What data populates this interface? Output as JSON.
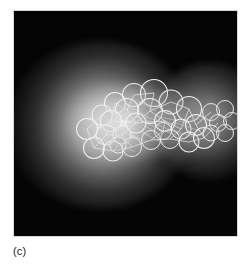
{
  "figure": {
    "caption_label": "(c)",
    "panel_background_color": "#050505",
    "panel_border_color": "#d8d8d8",
    "page_background_color": "#ffffff",
    "caption_text_color": "#1a1a1a",
    "overlay_stroke_color": "#f0f0f0",
    "title": "",
    "alt_description": "Grayscale molecular structure: space-filling atom outlines with wireframe bonds overlaid on a diffuse two-lobed density cloud against a black background"
  },
  "density_field": {
    "name": "electron-density-glow",
    "lobes": [
      {
        "id": "glow-main",
        "label": "primary-density-lobe",
        "center_x": 86,
        "center_y": 114,
        "radius_x": 92,
        "radius_y": 84,
        "peak_gray": "#e7e7e7"
      },
      {
        "id": "glow-secondary",
        "label": "secondary-density-lobe",
        "center_x": 196,
        "center_y": 110,
        "radius_x": 58,
        "radius_y": 58,
        "peak_gray": "#b0b0b0"
      },
      {
        "id": "glow-core",
        "label": "bright-core",
        "center_x": 112,
        "center_y": 111,
        "radius_x": 60,
        "radius_y": 39,
        "peak_gray": "#f6f6f6"
      },
      {
        "id": "glow-bridge",
        "label": "bridging-haze",
        "center_x": 163,
        "center_y": 113,
        "radius_x": 43,
        "radius_y": 35,
        "peak_gray": "#969696"
      }
    ]
  },
  "molecule": {
    "name": "molecular-structure-overlay",
    "atom_count": 31,
    "atoms": [
      {
        "cx": 120,
        "cy": 84,
        "r": 11.5
      },
      {
        "cx": 140,
        "cy": 82,
        "r": 13.5
      },
      {
        "cx": 101,
        "cy": 92,
        "r": 10.5
      },
      {
        "cx": 157,
        "cy": 91,
        "r": 12.0
      },
      {
        "cx": 113,
        "cy": 99,
        "r": 11.5
      },
      {
        "cx": 136,
        "cy": 100,
        "r": 12.5
      },
      {
        "cx": 88,
        "cy": 104,
        "r": 10.0
      },
      {
        "cx": 175,
        "cy": 98,
        "r": 12.5
      },
      {
        "cx": 97,
        "cy": 110,
        "r": 10.5
      },
      {
        "cx": 122,
        "cy": 112,
        "r": 10.0
      },
      {
        "cx": 151,
        "cy": 110,
        "r": 10.5
      },
      {
        "cx": 73,
        "cy": 118,
        "r": 10.5
      },
      {
        "cx": 92,
        "cy": 124,
        "r": 10.0
      },
      {
        "cx": 108,
        "cy": 124,
        "r": 9.0
      },
      {
        "cx": 167,
        "cy": 118,
        "r": 10.0
      },
      {
        "cx": 182,
        "cy": 114,
        "r": 10.5
      },
      {
        "cx": 80,
        "cy": 137,
        "r": 10.5
      },
      {
        "cx": 99,
        "cy": 140,
        "r": 10.0
      },
      {
        "cx": 118,
        "cy": 136,
        "r": 9.5
      },
      {
        "cx": 137,
        "cy": 129,
        "r": 9.5
      },
      {
        "cx": 156,
        "cy": 128,
        "r": 9.5
      },
      {
        "cx": 175,
        "cy": 131,
        "r": 10.0
      },
      {
        "cx": 190,
        "cy": 127,
        "r": 10.5
      },
      {
        "cx": 197,
        "cy": 101,
        "r": 8.5
      },
      {
        "cx": 211,
        "cy": 98,
        "r": 8.5
      },
      {
        "cx": 204,
        "cy": 112,
        "r": 8.5
      },
      {
        "cx": 218,
        "cy": 110,
        "r": 8.5
      },
      {
        "cx": 197,
        "cy": 122,
        "r": 8.0
      },
      {
        "cx": 211,
        "cy": 122,
        "r": 8.5
      },
      {
        "cx": 149,
        "cy": 120,
        "r": 8.5
      },
      {
        "cx": 104,
        "cy": 134,
        "r": 8.0
      }
    ],
    "bond_count": 38
  }
}
